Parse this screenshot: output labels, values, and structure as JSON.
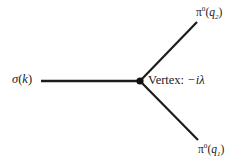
{
  "figure": {
    "kind": "feynman-vertex-diagram",
    "background_color": "#ffffff",
    "line_color": "#1c1c1c",
    "text_color": "#222222"
  },
  "vertex": {
    "dot_label": "vertex-dot",
    "annotation_prefix": "Vertex:",
    "annotation_value": "−iλ",
    "annotation_full": "Vertex: −iλ",
    "x": 140,
    "y": 81,
    "radius": 3.6
  },
  "legs": [
    {
      "name": "incoming-sigma",
      "label_symbol": "σ",
      "label_superscript": "",
      "label_momentum": "k",
      "label_full": "σ(k)",
      "direction": "incoming-left",
      "x1": 41,
      "y1": 81,
      "x2": 140,
      "y2": 81
    },
    {
      "name": "outgoing-pion-top",
      "label_symbol": "π",
      "label_superscript": "0",
      "label_momentum": "q₂",
      "label_full": "π⁰(q₂)",
      "direction": "outgoing-upper-right",
      "x1": 140,
      "y1": 81,
      "x2": 197,
      "y2": 22
    },
    {
      "name": "outgoing-pion-bottom",
      "label_symbol": "π",
      "label_superscript": "0",
      "label_momentum": "q₁",
      "label_full": "π⁰(q₁)",
      "direction": "outgoing-lower-right",
      "x1": 140,
      "y1": 81,
      "x2": 198,
      "y2": 140
    }
  ],
  "labels": {
    "incoming": {
      "symbol": "σ",
      "open_paren": "(",
      "momentum": "k",
      "close_paren": ")"
    },
    "outgoing_top": {
      "symbol": "π",
      "superscript": "0",
      "open_paren": "(",
      "momentum": "q",
      "subscript": "2",
      "close_paren": ")"
    },
    "outgoing_bottom": {
      "symbol": "π",
      "superscript": "0",
      "open_paren": "(",
      "momentum": "q",
      "subscript": "1",
      "close_paren": ")"
    },
    "vertex": {
      "text": "Vertex:",
      "coupling": "−iλ"
    }
  }
}
